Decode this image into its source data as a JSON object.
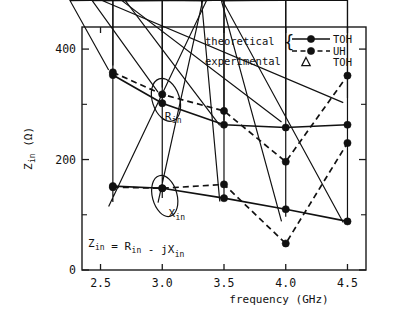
{
  "chart_data": {
    "type": "line",
    "title": "",
    "xlabel": "frequency (GHz)",
    "ylabel": "Z_in (Ω)",
    "ylabel_main": "Z",
    "ylabel_sub": "in",
    "ylabel_unit": "(Ω)",
    "xlim": [
      2.35,
      4.65
    ],
    "ylim": [
      0,
      440
    ],
    "grid": false,
    "legend_position": "top-right",
    "equation": "Z_in = R_in - jX_in",
    "equation_parts": {
      "z": "Z",
      "z_sub": "in",
      "eq": " = ",
      "r": "R",
      "r_sub": "in",
      "minus": " - j",
      "x": "X",
      "x_sub": "in"
    },
    "xticks": [
      2.5,
      3.0,
      3.5,
      4.0,
      4.5
    ],
    "xticklabels": [
      "2.5",
      "3.0",
      "3.5",
      "4.0",
      "4.5"
    ],
    "yticks": [
      0,
      200,
      400
    ],
    "yticklabels": [
      "0",
      "200",
      "400"
    ],
    "yticks_minor": [
      100,
      300
    ],
    "annotations": [
      {
        "label": "R",
        "sub": "in",
        "x": 3.02,
        "y": 272,
        "ellipse_cx": 3.03,
        "ellipse_cy": 308,
        "ellipse_rx": 0.11,
        "ellipse_ry": 40,
        "ellipse_rot": -18
      },
      {
        "label": "X",
        "sub": "in",
        "x": 3.05,
        "y": 96,
        "ellipse_cx": 3.02,
        "ellipse_cy": 134,
        "ellipse_rx": 0.1,
        "ellipse_ry": 38,
        "ellipse_rot": -15
      }
    ],
    "legend": {
      "group_label": "theoretical",
      "group_label_2": "experimental",
      "brace": "{",
      "entries": [
        {
          "name": "TOH",
          "style": "solid",
          "marker": "dot",
          "group": "theoretical"
        },
        {
          "name": "UH",
          "style": "dashed",
          "marker": "dot",
          "group": "theoretical"
        },
        {
          "name": "TOH",
          "style": "none",
          "marker": "triangle",
          "group": "experimental"
        }
      ]
    },
    "series": [
      {
        "name": "R_in theoretical TOH",
        "quantity": "R_in",
        "source": "TOH",
        "kind": "theoretical",
        "style": "solid",
        "marker": "dot",
        "x": [
          2.6,
          3.0,
          3.5,
          4.0,
          4.5
        ],
        "values": [
          353,
          302,
          263,
          258,
          263
        ]
      },
      {
        "name": "R_in theoretical UH",
        "quantity": "R_in",
        "source": "UH",
        "kind": "theoretical",
        "style": "dashed",
        "marker": "dot",
        "x": [
          2.6,
          3.0,
          3.5,
          4.0,
          4.5
        ],
        "values": [
          358,
          318,
          288,
          196,
          352
        ]
      },
      {
        "name": "R_in experimental TOH",
        "quantity": "R_in",
        "source": "TOH",
        "kind": "experimental",
        "style": "none",
        "marker": "triangle",
        "x": [
          2.6,
          3.0,
          3.5,
          4.0,
          4.5
        ],
        "values": [
          362,
          322,
          262,
          268,
          303
        ]
      },
      {
        "name": "X_in theoretical TOH",
        "quantity": "X_in",
        "source": "TOH",
        "kind": "theoretical",
        "style": "solid",
        "marker": "dot",
        "x": [
          2.6,
          3.0,
          3.5,
          4.0,
          4.5
        ],
        "values": [
          152,
          148,
          130,
          110,
          88
        ]
      },
      {
        "name": "X_in theoretical UH",
        "quantity": "X_in",
        "source": "UH",
        "kind": "theoretical",
        "style": "dashed",
        "marker": "dot",
        "x": [
          2.6,
          3.0,
          3.5,
          4.0,
          4.5
        ],
        "values": [
          150,
          148,
          155,
          48,
          230
        ]
      },
      {
        "name": "X_in experimental TOH",
        "quantity": "X_in",
        "source": "TOH",
        "kind": "experimental",
        "style": "none",
        "marker": "triangle",
        "x": [
          2.6,
          3.0,
          3.5,
          4.0,
          4.5
        ],
        "values": [
          115,
          122,
          124,
          88,
          86
        ]
      }
    ]
  }
}
